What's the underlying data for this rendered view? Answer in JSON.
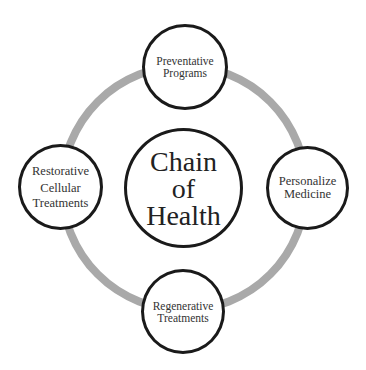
{
  "diagram": {
    "ring_color": "#a9a9a9",
    "border_color": "#1a1a1a",
    "center": {
      "lines": [
        "Chain",
        "of",
        "Health"
      ]
    },
    "nodes": {
      "top": {
        "lines": [
          "Preventative",
          "Programs"
        ]
      },
      "right": {
        "lines": [
          "Personalize",
          "Medicine"
        ]
      },
      "bottom": {
        "lines": [
          "Regenerative",
          "Treatments"
        ]
      },
      "left": {
        "lines": [
          "Restorative",
          "Cellular",
          "Treatments"
        ]
      }
    }
  }
}
